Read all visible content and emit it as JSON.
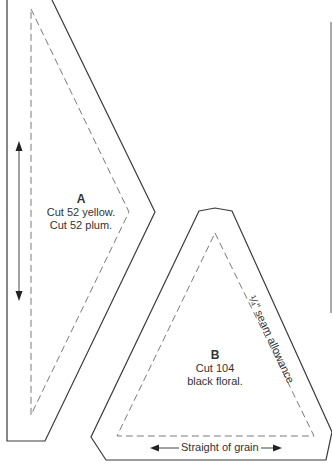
{
  "pieces": [
    {
      "id": "A",
      "letter": "A",
      "lines": [
        "Cut 52 yellow.",
        "Cut 52 plum."
      ]
    },
    {
      "id": "B",
      "letter": "B",
      "lines": [
        "Cut 104",
        "black floral."
      ]
    }
  ],
  "annotations": {
    "seam_allowance": "¼\" seam allowance",
    "grain": "Straight of grain"
  },
  "colors": {
    "outline": "#3a3a3a",
    "seam": "#7a7a7a",
    "background": "#ffffff"
  }
}
